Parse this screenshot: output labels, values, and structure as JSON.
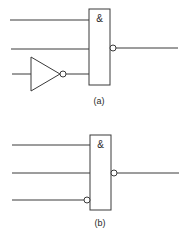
{
  "diagram": {
    "a": {
      "label": "(a)",
      "gate_symbol": "&",
      "gate_type": "AND with inverted output (NAND), third input via external inverter"
    },
    "b": {
      "label": "(b)",
      "gate_symbol": "&",
      "gate_type": "AND with inverted output (NAND), third input with inversion bubble"
    },
    "colors": {
      "line": "#3a3a3a",
      "background": "#ffffff"
    }
  }
}
